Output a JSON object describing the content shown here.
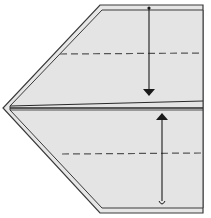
{
  "diagram": {
    "type": "origami-fold-step",
    "colors": {
      "background": "#ffffff",
      "paper_fill": "#e6e6e6",
      "outline": "#3a3a3a",
      "crease": "#2a2a2a",
      "arrow": "#1a1a1a",
      "dashed": "#555555"
    },
    "folds": [
      {
        "name": "top-valley-fold",
        "line": "dashed",
        "y": 54,
        "arrow_direction": "down"
      },
      {
        "name": "bottom-valley-fold",
        "line": "dashed",
        "y": 154,
        "arrow_direction": "up"
      }
    ],
    "center_crease_y": 108
  }
}
